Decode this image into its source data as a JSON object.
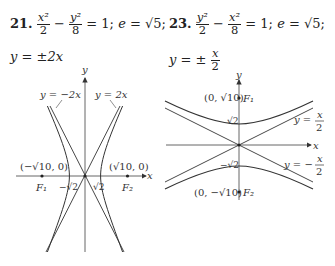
{
  "problems": [
    {
      "number": "21.",
      "equation": {
        "term1_num": "x²",
        "term1_den": "2",
        "op": "−",
        "term2_num": "y²",
        "term2_den": "8",
        "rhs": "= 1;",
        "eccentricity_label": "e",
        "eccentricity_value": "= √5;"
      },
      "asymptotes": {
        "prefix": "y =",
        "value": "±2x"
      },
      "graph": {
        "axis_x_label": "x",
        "axis_y_label": "y",
        "asymptote_labels": [
          "y = −2x",
          "y = 2x"
        ],
        "focus_labels": [
          "F₁",
          "F₂"
        ],
        "focus_coords": [
          "(−√10, 0)",
          "(√10, 0)"
        ],
        "vertex_labels": [
          "−√2",
          "√2"
        ]
      }
    },
    {
      "number": "23.",
      "equation": {
        "term1_num": "y²",
        "term1_den": "2",
        "op": "−",
        "term2_num": "x²",
        "term2_den": "8",
        "rhs": "= 1;",
        "eccentricity_label": "e",
        "eccentricity_value": "= √5;"
      },
      "asymptotes": {
        "prefix": "y =",
        "sign": "±",
        "num": "x",
        "den": "2"
      },
      "graph": {
        "axis_x_label": "x",
        "axis_y_label": "y",
        "asymptote_labels": [
          {
            "prefix": "y =",
            "num": "x",
            "den": "2"
          },
          {
            "prefix": "y = −",
            "num": "x",
            "den": "2"
          }
        ],
        "focus_labels": [
          "F₁",
          "F₂"
        ],
        "focus_coords": [
          "(0, √10)",
          "(0, −√10)"
        ],
        "vertex_labels": [
          "√2",
          "−√2"
        ]
      }
    }
  ]
}
